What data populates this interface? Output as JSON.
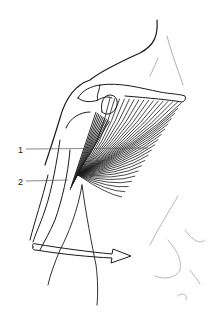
{
  "figure": {
    "labels": [
      {
        "id": "1",
        "text": "1"
      },
      {
        "id": "2",
        "text": "2"
      }
    ],
    "arrow": {
      "meaning": "internal rotation / adduction direction",
      "direction": "right"
    },
    "colors": {
      "ink": "#1a1a1a",
      "faint": "#9a9a9a",
      "background": "#ffffff"
    }
  }
}
